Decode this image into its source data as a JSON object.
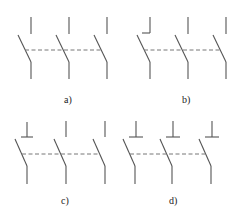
{
  "diagram": {
    "type": "three-pole switch symbol variants",
    "panels": [
      {
        "id": "a",
        "label": "a)",
        "upper_contacts": [
          "plain",
          "plain",
          "plain"
        ]
      },
      {
        "id": "b",
        "label": "b)",
        "upper_contacts": [
          "l-foot",
          "plain",
          "plain"
        ]
      },
      {
        "id": "c",
        "label": "c)",
        "upper_contacts": [
          "inverted-t",
          "plain",
          "plain"
        ]
      },
      {
        "id": "d",
        "label": "d)",
        "upper_contacts": [
          "inverted-t",
          "inverted-t",
          "inverted-t"
        ]
      }
    ],
    "colors": {
      "line": "#555555",
      "dash": "#777777",
      "background": "#ffffff"
    }
  }
}
